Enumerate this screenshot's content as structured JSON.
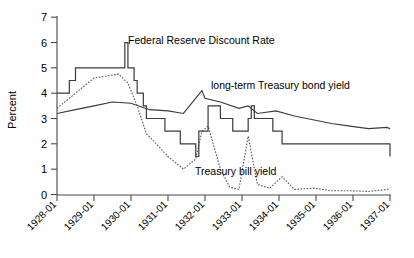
{
  "chart_data": {
    "type": "line",
    "title": "",
    "xlabel": "",
    "ylabel": "Percent",
    "ylim": [
      0,
      7
    ],
    "yticks": [
      0,
      1,
      2,
      3,
      4,
      5,
      6,
      7
    ],
    "ytick_labels": [
      "0",
      "1",
      "2",
      "3",
      "4",
      "5",
      "6",
      "7"
    ],
    "xlim": [
      "1928-01",
      "1937-01"
    ],
    "xticks": [
      "1928-01",
      "1929-01",
      "1930-01",
      "1931-01",
      "1932-01",
      "1933-01",
      "1934-01",
      "1935-01",
      "1936-01",
      "1937-01"
    ],
    "grid": false,
    "legend_position": "inline-annotations",
    "annotations": [
      {
        "text": "Federal Reserve Discount Rate",
        "x_px": 128,
        "y_px": 44
      },
      {
        "text": "long-term Treasury bond yield",
        "x_px": 211,
        "y_px": 89
      },
      {
        "text": "Treasury bill yield",
        "x_px": 195,
        "y_px": 175
      }
    ],
    "series": [
      {
        "name": "Federal Reserve Discount Rate",
        "style": "step-solid",
        "x": [
          "1928-01",
          "1928-02",
          "1928-05",
          "1928-07",
          "1929-08",
          "1929-11",
          "1929-12",
          "1930-02",
          "1930-03",
          "1930-05",
          "1930-06",
          "1930-12",
          "1931-05",
          "1931-10",
          "1931-11",
          "1932-02",
          "1932-06",
          "1932-10",
          "1933-03",
          "1933-04",
          "1933-05",
          "1933-11",
          "1934-02",
          "1937-01"
        ],
        "values": [
          4.0,
          4.0,
          4.5,
          5.0,
          5.0,
          6.0,
          5.0,
          4.5,
          4.0,
          3.5,
          3.0,
          2.5,
          2.0,
          1.5,
          2.5,
          3.5,
          3.0,
          2.5,
          3.0,
          3.5,
          3.0,
          2.5,
          2.0,
          1.5
        ]
      },
      {
        "name": "long-term Treasury bond yield",
        "style": "line-solid",
        "x": [
          "1928-01",
          "1928-07",
          "1929-01",
          "1929-07",
          "1930-01",
          "1930-07",
          "1931-01",
          "1931-06",
          "1931-12",
          "1932-01",
          "1932-06",
          "1932-12",
          "1933-03",
          "1933-06",
          "1933-12",
          "1934-06",
          "1934-12",
          "1935-06",
          "1935-12",
          "1936-06",
          "1936-12",
          "1937-01"
        ],
        "values": [
          3.2,
          3.35,
          3.5,
          3.65,
          3.6,
          3.35,
          3.3,
          3.2,
          4.1,
          3.8,
          3.65,
          3.4,
          3.5,
          3.2,
          3.3,
          3.1,
          2.95,
          2.8,
          2.7,
          2.6,
          2.65,
          2.6
        ]
      },
      {
        "name": "Treasury bill yield",
        "style": "line-dotted",
        "x": [
          "1928-01",
          "1928-06",
          "1929-01",
          "1929-06",
          "1929-09",
          "1929-12",
          "1930-03",
          "1930-06",
          "1930-10",
          "1931-01",
          "1931-06",
          "1931-10",
          "1931-12",
          "1932-02",
          "1932-06",
          "1932-09",
          "1932-12",
          "1933-03",
          "1933-06",
          "1933-10",
          "1934-02",
          "1934-06",
          "1934-12",
          "1935-06",
          "1935-12",
          "1936-06",
          "1936-12",
          "1937-01"
        ],
        "values": [
          3.4,
          3.9,
          4.6,
          4.7,
          4.75,
          4.4,
          3.5,
          2.4,
          1.9,
          1.5,
          1.0,
          1.4,
          2.5,
          2.7,
          1.0,
          0.3,
          0.2,
          2.3,
          0.4,
          0.25,
          0.7,
          0.2,
          0.25,
          0.15,
          0.15,
          0.12,
          0.2,
          0.22
        ]
      }
    ]
  },
  "axis": {
    "y_title": "Percent"
  }
}
